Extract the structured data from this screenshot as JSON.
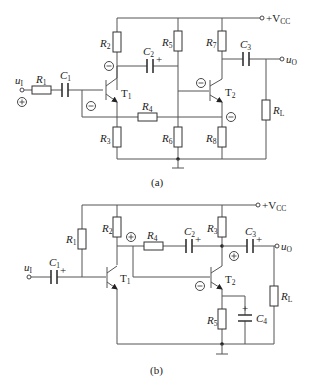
{
  "circuit_a": {
    "caption": "(a)",
    "input_label": "u",
    "input_sub": "I",
    "output_label": "u",
    "output_sub": "O",
    "supply_label": "+V",
    "supply_sub": "CC",
    "resistors": [
      {
        "name": "R",
        "sub": "1"
      },
      {
        "name": "R",
        "sub": "2"
      },
      {
        "name": "R",
        "sub": "3"
      },
      {
        "name": "R",
        "sub": "4"
      },
      {
        "name": "R",
        "sub": "5"
      },
      {
        "name": "R",
        "sub": "6"
      },
      {
        "name": "R",
        "sub": "7"
      },
      {
        "name": "R",
        "sub": "8"
      },
      {
        "name": "R",
        "sub": "L"
      }
    ],
    "capacitors": [
      {
        "name": "C",
        "sub": "1"
      },
      {
        "name": "C",
        "sub": "2"
      },
      {
        "name": "C",
        "sub": "3"
      }
    ],
    "transistors": [
      {
        "name": "T",
        "sub": "1"
      },
      {
        "name": "T",
        "sub": "2"
      }
    ],
    "polarity_marks": [
      "plus-input",
      "minus-T1-collector",
      "minus-T1-base",
      "minus-T2-base",
      "minus-T2-emitter"
    ],
    "cap_plus": "+"
  },
  "circuit_b": {
    "caption": "(b)",
    "input_label": "u",
    "input_sub": "I",
    "output_label": "u",
    "output_sub": "O",
    "supply_label": "+V",
    "supply_sub": "CC",
    "resistors": [
      {
        "name": "R",
        "sub": "1"
      },
      {
        "name": "R",
        "sub": "2"
      },
      {
        "name": "R",
        "sub": "3"
      },
      {
        "name": "R",
        "sub": "4"
      },
      {
        "name": "R",
        "sub": "5"
      },
      {
        "name": "R",
        "sub": "L"
      }
    ],
    "capacitors": [
      {
        "name": "C",
        "sub": "1"
      },
      {
        "name": "C",
        "sub": "2"
      },
      {
        "name": "C",
        "sub": "3"
      },
      {
        "name": "C",
        "sub": "4"
      }
    ],
    "transistors": [
      {
        "name": "T",
        "sub": "1"
      },
      {
        "name": "T",
        "sub": "2"
      }
    ],
    "polarity_marks": [
      "plus-T1-collector",
      "plus-T2-collector",
      "minus-T2-base"
    ],
    "cap_plus": "+"
  }
}
